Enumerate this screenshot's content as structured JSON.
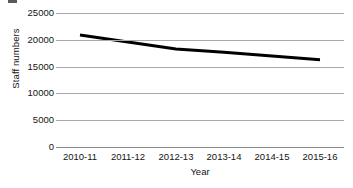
{
  "chart_data": {
    "type": "line",
    "title": "",
    "xlabel": "Year",
    "ylabel": "Staff numbers",
    "categories": [
      "2010-11",
      "2011-12",
      "2012-13",
      "2013-14",
      "2014-15",
      "2015-16"
    ],
    "values": [
      20900,
      19600,
      18300,
      17700,
      17000,
      16300
    ],
    "series": [
      {
        "name": "Staff numbers",
        "values": [
          20900,
          19600,
          18300,
          17700,
          17000,
          16300
        ],
        "color": "#000000"
      }
    ],
    "ylim": [
      0,
      25000
    ],
    "yticks": [
      0,
      5000,
      10000,
      15000,
      20000,
      25000
    ],
    "ytick_labels": [
      "0",
      "5000",
      "10000",
      "15000",
      "20000",
      "25000"
    ],
    "grid": true,
    "grid_axis": "y",
    "legend": false,
    "legend_position": "none",
    "markers": false,
    "line_width_px": 3,
    "axis_color": "#a9a9a9",
    "text_color": "#141414",
    "background": "#ffffff"
  }
}
